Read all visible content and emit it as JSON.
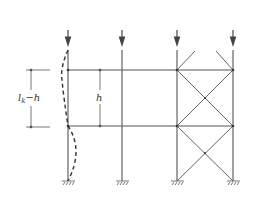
{
  "diagram": {
    "type": "frame-buckling",
    "labels": {
      "left_dimension": "l",
      "left_dimension_sub": "k",
      "left_dimension_rest": "−h",
      "center_dimension": "h"
    },
    "columns": [
      {
        "name": "left-column",
        "x": 68,
        "buckled": true
      },
      {
        "name": "middle-column",
        "x": 120
      },
      {
        "name": "braced-left-column",
        "x": 177
      },
      {
        "name": "braced-right-column",
        "x": 233
      }
    ],
    "beams_y": [
      70,
      126
    ],
    "base_y": 181,
    "colors": {
      "line": "#555555",
      "text": "#333333"
    }
  }
}
